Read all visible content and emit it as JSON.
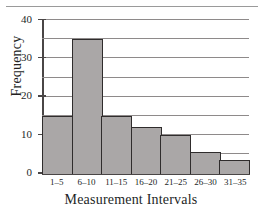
{
  "chart_data": {
    "type": "bar",
    "title": "",
    "xlabel": "Measurement Intervals",
    "ylabel": "Frequency",
    "categories": [
      "1–5",
      "6–10",
      "11–15",
      "16–20",
      "21–25",
      "26–30",
      "31–35"
    ],
    "values": [
      15,
      35,
      15,
      12,
      10,
      5.5,
      3.5
    ],
    "ylim": [
      0,
      40
    ],
    "yticks": [
      0,
      10,
      20,
      30,
      40
    ],
    "ytick_labels": [
      "0",
      "10",
      "20",
      "30",
      "40"
    ],
    "gridlines": [
      5,
      10,
      15,
      20,
      25,
      30,
      35,
      40
    ],
    "grid": true,
    "legend": "none",
    "bar_color": "#aaa7a7",
    "bar_edge_color": "#2f2c2c",
    "axis_color": "#4a4646",
    "grid_color": "#8e8a8a"
  }
}
